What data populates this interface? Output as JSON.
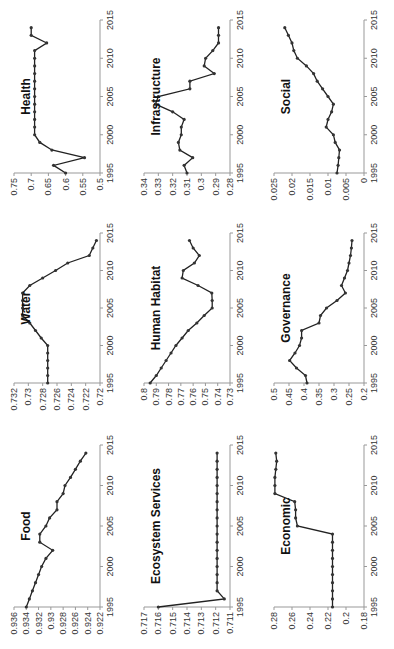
{
  "figure": {
    "orientation": "rotated -90 degrees",
    "layout": "3x3 small multiples"
  },
  "chart_data": [
    {
      "id": "health",
      "type": "line",
      "title": "Health",
      "xlabel": "",
      "ylabel": "",
      "xlim": [
        1995,
        2015
      ],
      "xticks": [
        1995,
        2000,
        2005,
        2010,
        2015
      ],
      "ylim": [
        0.5,
        0.75
      ],
      "yticks": [
        0.5,
        0.55,
        0.6,
        0.65,
        0.7,
        0.75
      ],
      "ytick_labels": [
        "0.5",
        "0.55",
        "0.6",
        "0.65",
        "0.7",
        "0.75"
      ],
      "x": [
        1995,
        1996,
        1997,
        1998,
        1999,
        2000,
        2001,
        2002,
        2003,
        2004,
        2005,
        2006,
        2007,
        2008,
        2009,
        2010,
        2011,
        2012,
        2013,
        2014
      ],
      "values": [
        0.6,
        0.635,
        0.545,
        0.64,
        0.675,
        0.69,
        0.69,
        0.69,
        0.69,
        0.69,
        0.69,
        0.69,
        0.69,
        0.69,
        0.69,
        0.69,
        0.69,
        0.655,
        0.7,
        0.7
      ]
    },
    {
      "id": "water",
      "type": "line",
      "title": "Water",
      "xlim": [
        1995,
        2015
      ],
      "xticks": [
        1995,
        2000,
        2005,
        2010,
        2015
      ],
      "ylim": [
        0.72,
        0.732
      ],
      "yticks": [
        0.72,
        0.722,
        0.724,
        0.726,
        0.728,
        0.73,
        0.732
      ],
      "ytick_labels": [
        "0.72",
        "0.722",
        "0.724",
        "0.726",
        "0.728",
        "0.73",
        "0.732"
      ],
      "x": [
        1995,
        1996,
        1997,
        1998,
        1999,
        2000,
        2001,
        2002,
        2003,
        2004,
        2005,
        2006,
        2007,
        2008,
        2009,
        2010,
        2011,
        2012,
        2013,
        2014
      ],
      "values": [
        0.7273,
        0.7273,
        0.7273,
        0.7273,
        0.7273,
        0.7273,
        0.7282,
        0.729,
        0.7298,
        0.7308,
        0.7308,
        0.7308,
        0.7308,
        0.7298,
        0.728,
        0.7262,
        0.7245,
        0.7215,
        0.721,
        0.7205
      ]
    },
    {
      "id": "food",
      "type": "line",
      "title": "Food",
      "xlim": [
        1995,
        2015
      ],
      "xticks": [
        1995,
        2000,
        2005,
        2010,
        2015
      ],
      "ylim": [
        0.922,
        0.936
      ],
      "yticks": [
        0.922,
        0.924,
        0.926,
        0.928,
        0.93,
        0.932,
        0.934,
        0.936
      ],
      "ytick_labels": [
        "0.922",
        "0.924",
        "0.926",
        "0.928",
        "0.93",
        "0.932",
        "0.934",
        "0.936"
      ],
      "x": [
        1995,
        1996,
        1997,
        1998,
        1999,
        2000,
        2001,
        2002,
        2003,
        2004,
        2005,
        2006,
        2007,
        2008,
        2009,
        2010,
        2011,
        2012,
        2013,
        2014
      ],
      "values": [
        0.934,
        0.9335,
        0.933,
        0.9325,
        0.932,
        0.9315,
        0.9308,
        0.9297,
        0.9318,
        0.9318,
        0.9308,
        0.9302,
        0.929,
        0.929,
        0.928,
        0.9277,
        0.9268,
        0.926,
        0.9252,
        0.9243
      ]
    },
    {
      "id": "infrastructure",
      "type": "line",
      "title": "Infrastructure",
      "xlim": [
        1995,
        2015
      ],
      "xticks": [
        1995,
        2000,
        2005,
        2010,
        2015
      ],
      "ylim": [
        0.28,
        0.34
      ],
      "yticks": [
        0.28,
        0.29,
        0.3,
        0.31,
        0.32,
        0.33,
        0.34
      ],
      "ytick_labels": [
        "0.28",
        "0.29",
        "0.3",
        "0.31",
        "0.32",
        "0.33",
        "0.34"
      ],
      "x": [
        1995,
        1996,
        1997,
        1998,
        1999,
        2000,
        2001,
        2002,
        2003,
        2004,
        2005,
        2006,
        2007,
        2008,
        2009,
        2010,
        2011,
        2012,
        2013,
        2014
      ],
      "values": [
        0.31,
        0.312,
        0.306,
        0.315,
        0.316,
        0.314,
        0.314,
        0.312,
        0.32,
        0.332,
        0.33,
        0.308,
        0.308,
        0.291,
        0.298,
        0.297,
        0.292,
        0.288,
        0.288,
        0.288
      ]
    },
    {
      "id": "human_habitat",
      "type": "line",
      "title": "Human Habitat",
      "xlim": [
        1995,
        2015
      ],
      "xticks": [
        1995,
        2000,
        2005,
        2010,
        2015
      ],
      "ylim": [
        0.73,
        0.8
      ],
      "yticks": [
        0.73,
        0.74,
        0.75,
        0.76,
        0.77,
        0.78,
        0.79,
        0.8
      ],
      "ytick_labels": [
        "0.73",
        "0.74",
        "0.75",
        "0.76",
        "0.77",
        "0.78",
        "0.79",
        "0.8"
      ],
      "x": [
        1995,
        1996,
        1997,
        1998,
        1999,
        2000,
        2001,
        2002,
        2003,
        2004,
        2005,
        2006,
        2007,
        2008,
        2009,
        2010,
        2011,
        2012,
        2013,
        2014
      ],
      "values": [
        0.795,
        0.79,
        0.786,
        0.782,
        0.778,
        0.774,
        0.769,
        0.764,
        0.757,
        0.751,
        0.7445,
        0.7445,
        0.7448,
        0.756,
        0.769,
        0.768,
        0.759,
        0.755,
        0.76,
        0.763
      ]
    },
    {
      "id": "ecosystem_services",
      "type": "line",
      "title": "Ecosystem Services",
      "xlim": [
        1995,
        2015
      ],
      "xticks": [
        1995,
        2000,
        2005,
        2010,
        2015
      ],
      "ylim": [
        0.711,
        0.717
      ],
      "yticks": [
        0.711,
        0.712,
        0.713,
        0.714,
        0.715,
        0.716,
        0.717
      ],
      "ytick_labels": [
        "0.711",
        "0.712",
        "0.713",
        "0.714",
        "0.715",
        "0.716",
        "0.717"
      ],
      "x": [
        1995,
        1996,
        1997,
        1998,
        1999,
        2000,
        2001,
        2002,
        2003,
        2004,
        2005,
        2006,
        2007,
        2008,
        2009,
        2010,
        2011,
        2012,
        2013,
        2014
      ],
      "values": [
        0.716,
        0.7114,
        0.7119,
        0.7119,
        0.7119,
        0.7119,
        0.7119,
        0.7119,
        0.7119,
        0.7119,
        0.7119,
        0.7119,
        0.7119,
        0.7119,
        0.7119,
        0.7119,
        0.7119,
        0.7119,
        0.7119,
        0.7119
      ]
    },
    {
      "id": "social",
      "type": "line",
      "title": "Social",
      "xlim": [
        1995,
        2015
      ],
      "xticks": [
        1995,
        2000,
        2005,
        2010,
        2015
      ],
      "ylim": [
        0,
        0.025
      ],
      "yticks": [
        0,
        0.005,
        0.01,
        0.015,
        0.02,
        0.025
      ],
      "ytick_labels": [
        "0",
        "0.005",
        "0.01",
        "0.015",
        "0.02",
        "0.025"
      ],
      "x": [
        1995,
        1996,
        1997,
        1998,
        1999,
        2000,
        2001,
        2002,
        2003,
        2004,
        2005,
        2006,
        2007,
        2008,
        2009,
        2010,
        2011,
        2012,
        2013,
        2014
      ],
      "values": [
        0.0075,
        0.0072,
        0.007,
        0.0068,
        0.008,
        0.0085,
        0.0105,
        0.01,
        0.009,
        0.0085,
        0.01,
        0.0115,
        0.013,
        0.014,
        0.016,
        0.0185,
        0.0195,
        0.02,
        0.021,
        0.022
      ]
    },
    {
      "id": "governance",
      "type": "line",
      "title": "Governance",
      "xlim": [
        1995,
        2015
      ],
      "xticks": [
        1995,
        2000,
        2005,
        2010,
        2015
      ],
      "ylim": [
        0.2,
        0.5
      ],
      "yticks": [
        0.2,
        0.25,
        0.3,
        0.35,
        0.4,
        0.45,
        0.5
      ],
      "ytick_labels": [
        "0.2",
        "0.25",
        "0.3",
        "0.35",
        "0.4",
        "0.45",
        "0.5"
      ],
      "x": [
        1995,
        1996,
        1997,
        1998,
        1999,
        2000,
        2001,
        2002,
        2003,
        2004,
        2005,
        2006,
        2007,
        2008,
        2009,
        2010,
        2011,
        2012,
        2013,
        2014
      ],
      "values": [
        0.39,
        0.395,
        0.425,
        0.448,
        0.43,
        0.415,
        0.408,
        0.408,
        0.35,
        0.345,
        0.325,
        0.29,
        0.262,
        0.275,
        0.265,
        0.255,
        0.25,
        0.245,
        0.242,
        0.24
      ]
    },
    {
      "id": "economic",
      "type": "line",
      "title": "Economic",
      "xlim": [
        1995,
        2015
      ],
      "xticks": [
        1995,
        2000,
        2005,
        2010,
        2015
      ],
      "ylim": [
        0.18,
        0.28
      ],
      "yticks": [
        0.18,
        0.2,
        0.22,
        0.24,
        0.26,
        0.28
      ],
      "ytick_labels": [
        "0.18",
        "0.2",
        "0.22",
        "0.24",
        "0.26",
        "0.28"
      ],
      "x": [
        1995,
        1996,
        1997,
        1998,
        1999,
        2000,
        2001,
        2002,
        2003,
        2004,
        2005,
        2006,
        2007,
        2008,
        2009,
        2010,
        2011,
        2012,
        2013,
        2014
      ],
      "values": [
        0.215,
        0.215,
        0.215,
        0.215,
        0.215,
        0.215,
        0.215,
        0.215,
        0.215,
        0.215,
        0.254,
        0.256,
        0.256,
        0.257,
        0.279,
        0.279,
        0.279,
        0.278,
        0.277,
        0.278
      ]
    }
  ],
  "panels": [
    {
      "chart": 0,
      "left": 0,
      "top": 0,
      "w": 130,
      "h": 215
    },
    {
      "chart": 1,
      "left": 0,
      "top": 213,
      "w": 130,
      "h": 212
    },
    {
      "chart": 2,
      "left": 0,
      "top": 425,
      "w": 130,
      "h": 224
    },
    {
      "chart": 3,
      "left": 130,
      "top": 0,
      "w": 130,
      "h": 215
    },
    {
      "chart": 4,
      "left": 130,
      "top": 213,
      "w": 130,
      "h": 212
    },
    {
      "chart": 5,
      "left": 130,
      "top": 425,
      "w": 130,
      "h": 224
    },
    {
      "chart": 6,
      "left": 260,
      "top": 0,
      "w": 134,
      "h": 215
    },
    {
      "chart": 7,
      "left": 260,
      "top": 213,
      "w": 134,
      "h": 212
    },
    {
      "chart": 8,
      "left": 260,
      "top": 425,
      "w": 134,
      "h": 224
    }
  ],
  "style": {
    "line_color": "#222222",
    "marker_color": "#333333",
    "axis_color": "#999999"
  }
}
